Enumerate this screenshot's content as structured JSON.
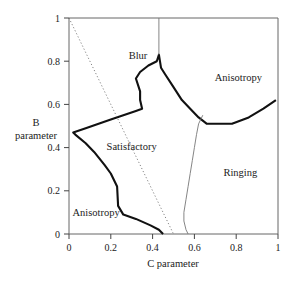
{
  "chart_data": {
    "type": "line",
    "title": "",
    "xlabel": "C parameter",
    "ylabel_lines": [
      "B",
      "parameter"
    ],
    "xlim": [
      0,
      1
    ],
    "ylim": [
      0,
      1
    ],
    "grid": false,
    "x_ticks": [
      {
        "value": 0,
        "label": "0"
      },
      {
        "value": 0.2,
        "label": "0.2"
      },
      {
        "value": 0.4,
        "label": "0.4"
      },
      {
        "value": 0.6,
        "label": "0.6"
      },
      {
        "value": 0.8,
        "label": "0.8"
      },
      {
        "value": 1,
        "label": "1"
      }
    ],
    "y_ticks": [
      {
        "value": 0,
        "label": "0"
      },
      {
        "value": 0.2,
        "label": "0.2"
      },
      {
        "value": 0.4,
        "label": "0.4"
      },
      {
        "value": 0.6,
        "label": "0.6"
      },
      {
        "value": 0.8,
        "label": "0.8"
      },
      {
        "value": 1,
        "label": "1"
      }
    ],
    "regions": [
      {
        "label": "Blur",
        "x": 0.33,
        "y": 0.81
      },
      {
        "label": "Anisotropy",
        "x": 0.81,
        "y": 0.71
      },
      {
        "label": "Satisfactory",
        "x": 0.3,
        "y": 0.39
      },
      {
        "label": "Ringing",
        "x": 0.82,
        "y": 0.27
      },
      {
        "label": "Anisotropy",
        "x": 0.13,
        "y": 0.085
      }
    ],
    "series": [
      {
        "name": "satisfactory-boundary",
        "style": "thick-solid",
        "points": [
          [
            0.45,
            0
          ],
          [
            0.43,
            0.02
          ],
          [
            0.39,
            0.04
          ],
          [
            0.32,
            0.07
          ],
          [
            0.26,
            0.09
          ],
          [
            0.235,
            0.13
          ],
          [
            0.23,
            0.22
          ],
          [
            0.2,
            0.28
          ],
          [
            0.17,
            0.32
          ],
          [
            0.12,
            0.38
          ],
          [
            0.08,
            0.42
          ],
          [
            0.03,
            0.46
          ],
          [
            0.02,
            0.47
          ],
          [
            0.08,
            0.49
          ],
          [
            0.2,
            0.53
          ],
          [
            0.32,
            0.57
          ],
          [
            0.35,
            0.58
          ],
          [
            0.34,
            0.62
          ],
          [
            0.34,
            0.66
          ],
          [
            0.32,
            0.72
          ],
          [
            0.34,
            0.75
          ],
          [
            0.38,
            0.78
          ],
          [
            0.42,
            0.8
          ],
          [
            0.43,
            0.83
          ],
          [
            0.44,
            0.77
          ],
          [
            0.46,
            0.74
          ],
          [
            0.5,
            0.68
          ],
          [
            0.54,
            0.62
          ],
          [
            0.58,
            0.58
          ],
          [
            0.62,
            0.54
          ],
          [
            0.66,
            0.51
          ],
          [
            0.72,
            0.51
          ],
          [
            0.78,
            0.51
          ],
          [
            0.86,
            0.54
          ],
          [
            0.93,
            0.58
          ],
          [
            0.99,
            0.62
          ]
        ]
      },
      {
        "name": "ringing-boundary",
        "style": "thin-solid",
        "points": [
          [
            0.64,
            0.55
          ],
          [
            0.62,
            0.51
          ],
          [
            0.61,
            0.46
          ],
          [
            0.6,
            0.4
          ],
          [
            0.59,
            0.34
          ],
          [
            0.58,
            0.28
          ],
          [
            0.57,
            0.22
          ],
          [
            0.56,
            0.16
          ],
          [
            0.55,
            0.1
          ],
          [
            0.55,
            0.06
          ],
          [
            0.56,
            0.02
          ],
          [
            0.57,
            0
          ]
        ]
      },
      {
        "name": "vertical-line-top",
        "style": "thin-solid",
        "points": [
          [
            0.43,
            0.83
          ],
          [
            0.43,
            1
          ]
        ]
      },
      {
        "name": "diagonal-reference",
        "style": "dotted",
        "points": [
          [
            0,
            1
          ],
          [
            0.5,
            0
          ]
        ]
      }
    ]
  }
}
